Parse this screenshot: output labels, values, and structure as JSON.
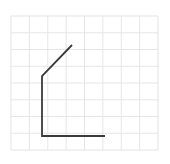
{
  "figure": {
    "title": "",
    "type": "polyline-on-grid",
    "canvas": {
      "width": 170,
      "height": 164,
      "background": "#ffffff"
    },
    "grid": {
      "visible": true,
      "color": "#e3e3e3",
      "border_color": "#e0e0e0",
      "stroke_width": 0.9,
      "columns": 8,
      "rows": 8,
      "x_start": 11,
      "x_end": 158,
      "y_start": 16,
      "y_end": 150,
      "cell_width": 18.375,
      "cell_height": 16.75
    },
    "polyline": {
      "name": "bent-path",
      "color": "#3a3a3a",
      "stroke_width": 1.8,
      "linecap": "butt",
      "linejoin": "miter",
      "points": [
        {
          "label": "upper-right-endpoint",
          "x": 72,
          "y": 45
        },
        {
          "label": "bend-vertex",
          "x": 42,
          "y": 76
        },
        {
          "label": "bottom-left-corner",
          "x": 42,
          "y": 136
        },
        {
          "label": "right-endpoint",
          "x": 105,
          "y": 136
        }
      ],
      "path_d": "M 72 45 L 42 76 L 42 136 L 105 136"
    },
    "segments": [
      {
        "name": "diagonal-segment",
        "from": "upper-right-endpoint",
        "to": "bend-vertex",
        "orientation": "diagonal"
      },
      {
        "name": "vertical-segment",
        "from": "bend-vertex",
        "to": "bottom-left-corner",
        "orientation": "vertical"
      },
      {
        "name": "horizontal-segment",
        "from": "bottom-left-corner",
        "to": "right-endpoint",
        "orientation": "horizontal"
      }
    ]
  }
}
